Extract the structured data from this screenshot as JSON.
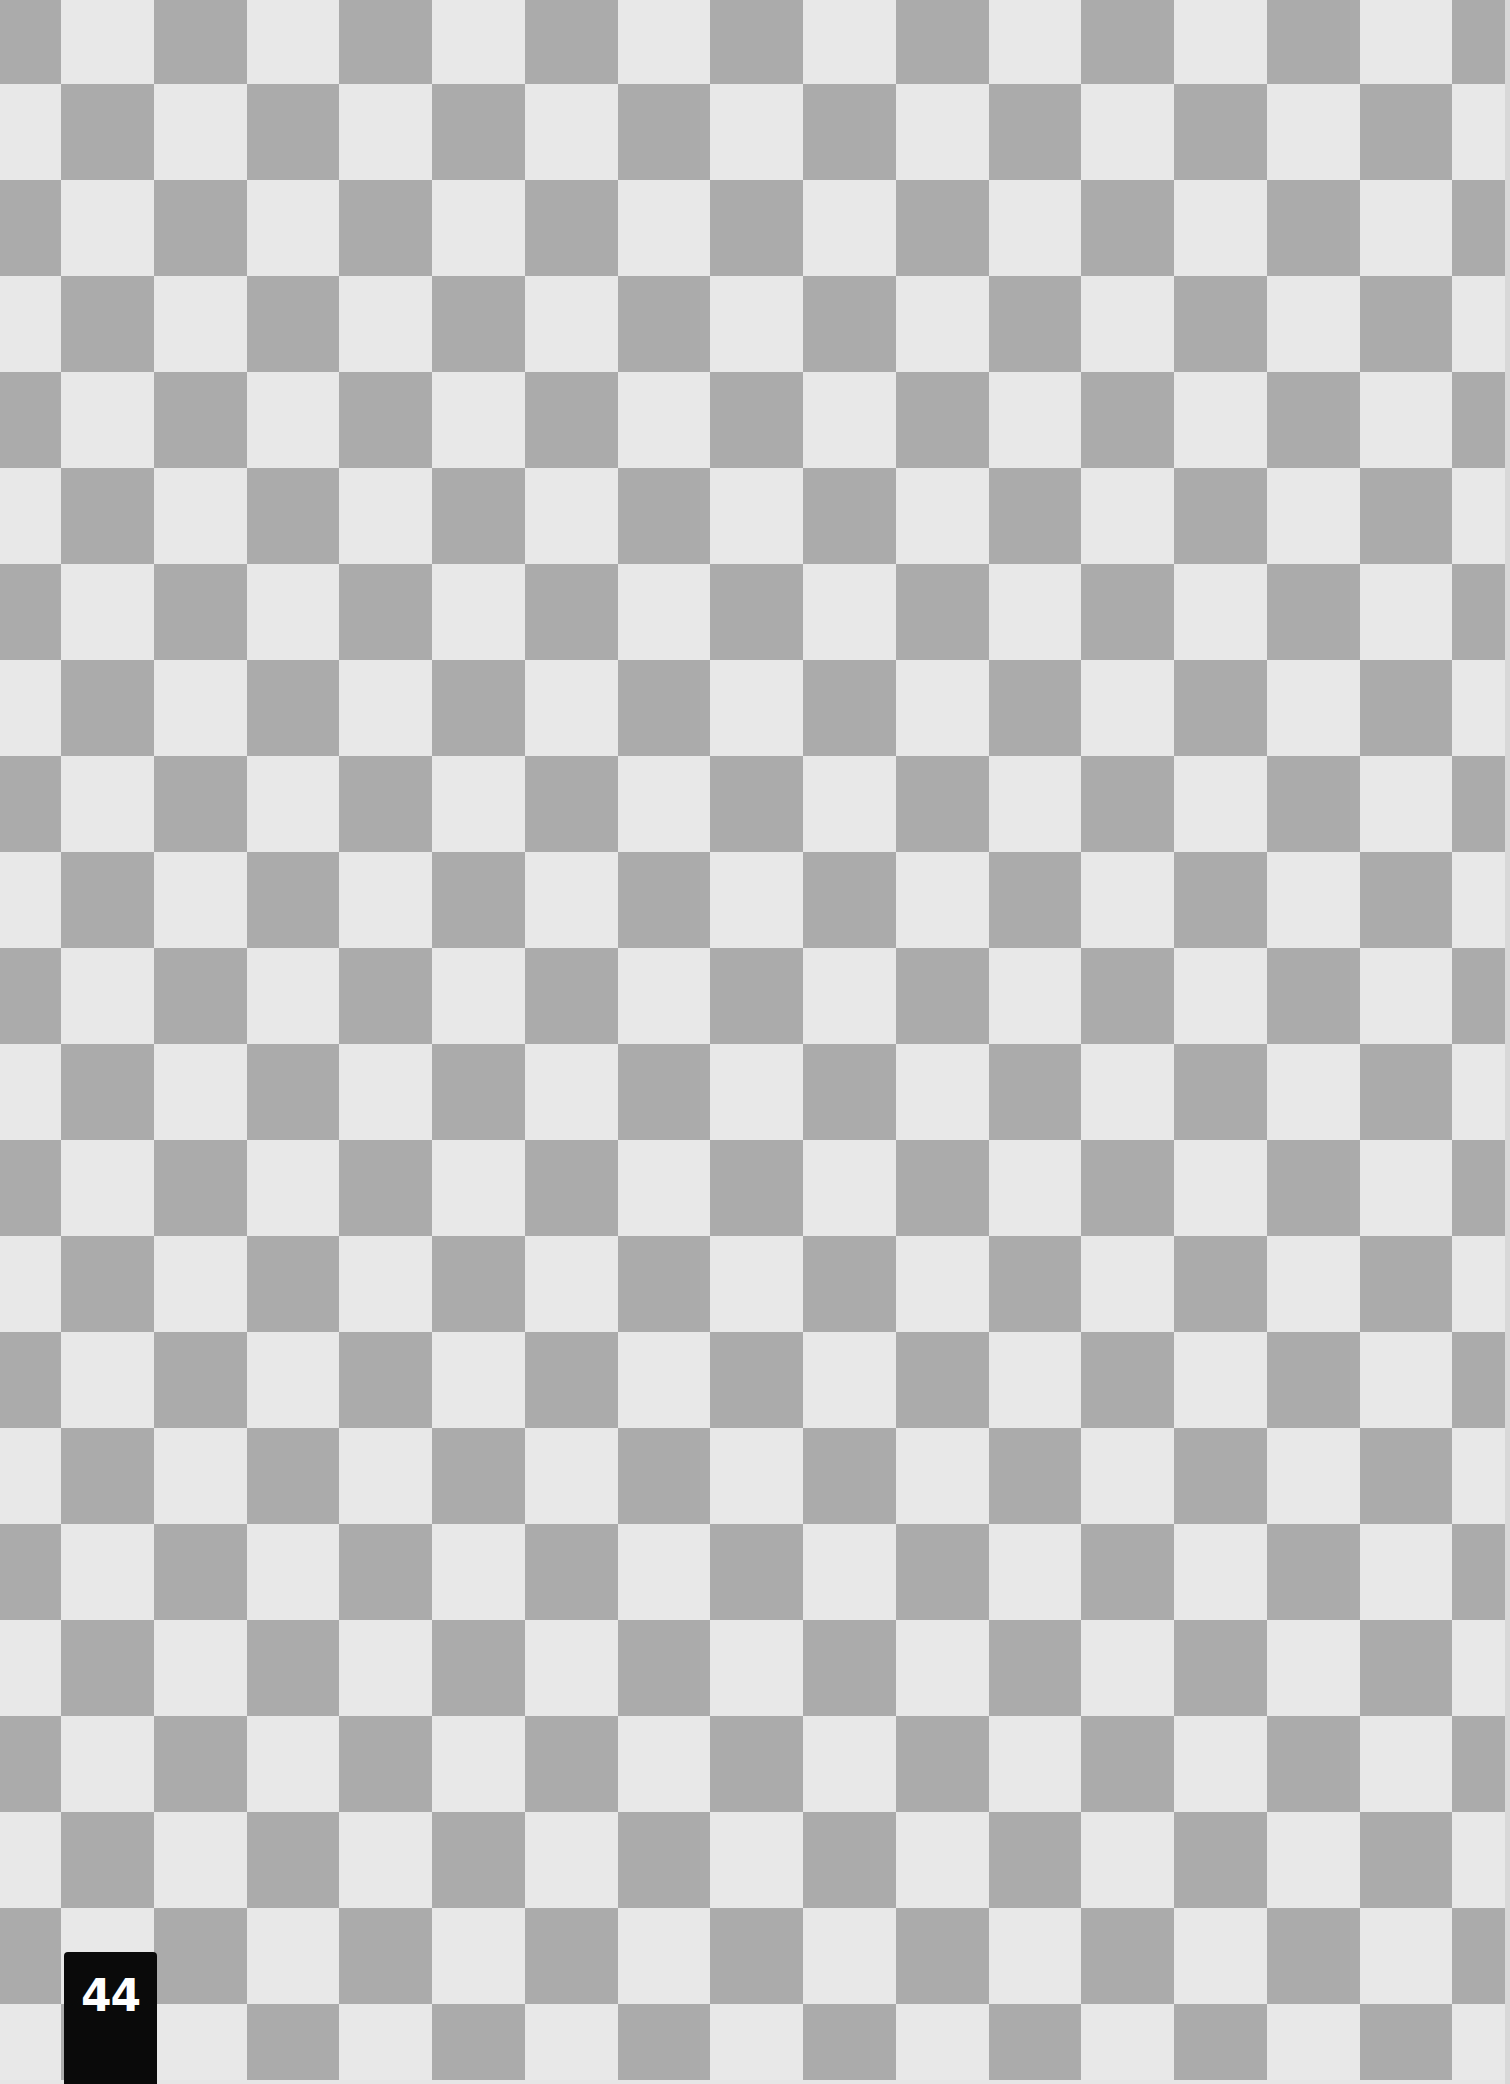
{
  "page": {
    "page_number": "44",
    "pattern": "checkerboard"
  },
  "board": {
    "light_color": "#e8e8e8",
    "dark_color": "#ababab",
    "first_col_width": 61,
    "col_pitch": 92.75,
    "cols": 17,
    "first_row_height": 84,
    "row_pitch": 96,
    "rows": 22,
    "width": 1505,
    "height": 2080
  },
  "tab": {
    "background": "#0a0a0a",
    "text_color": "#ffffff"
  }
}
